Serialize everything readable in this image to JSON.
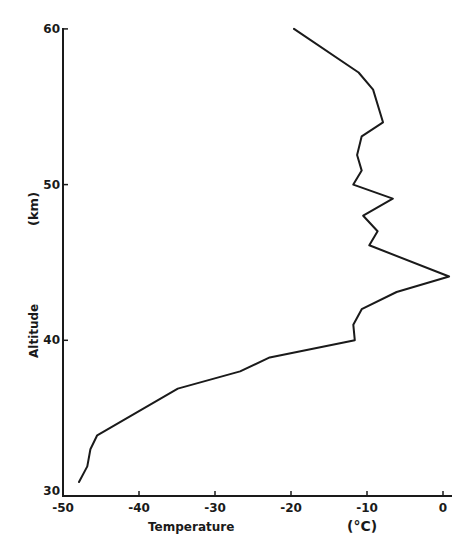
{
  "chart_data": {
    "type": "line",
    "title": "",
    "xlabel": "Temperature",
    "xunit": "(°C)",
    "ylabel": "Altitude",
    "yunit": "(km)",
    "xlim": [
      -50,
      1
    ],
    "ylim": [
      30,
      60
    ],
    "grid": false,
    "legend": null,
    "x_ticks": [
      -50,
      -40,
      -30,
      -20,
      -10,
      0
    ],
    "x_tick_labels": [
      "-50",
      "-40",
      "-30",
      "-20",
      "-10",
      "0"
    ],
    "y_ticks": [
      30,
      40,
      50,
      60
    ],
    "y_tick_labels": [
      "30",
      "40",
      "50",
      "60"
    ],
    "series": [
      {
        "name": "Temperature profile",
        "color": "#1a1a1a",
        "points": [
          {
            "t": -47.9,
            "alt": 30.9
          },
          {
            "t": -46.8,
            "alt": 31.9
          },
          {
            "t": -46.4,
            "alt": 33.0
          },
          {
            "t": -45.5,
            "alt": 33.9
          },
          {
            "t": -34.9,
            "alt": 36.9
          },
          {
            "t": -26.7,
            "alt": 38.0
          },
          {
            "t": -22.8,
            "alt": 38.9
          },
          {
            "t": -11.6,
            "alt": 40.0
          },
          {
            "t": -11.8,
            "alt": 41.0
          },
          {
            "t": -10.7,
            "alt": 42.0
          },
          {
            "t": -6.1,
            "alt": 43.1
          },
          {
            "t": 0.8,
            "alt": 44.1
          },
          {
            "t": -9.7,
            "alt": 46.1
          },
          {
            "t": -8.6,
            "alt": 47.0
          },
          {
            "t": -10.5,
            "alt": 48.0
          },
          {
            "t": -6.6,
            "alt": 49.1
          },
          {
            "t": -11.8,
            "alt": 50.0
          },
          {
            "t": -10.7,
            "alt": 50.9
          },
          {
            "t": -11.3,
            "alt": 51.9
          },
          {
            "t": -10.7,
            "alt": 53.1
          },
          {
            "t": -7.9,
            "alt": 54.0
          },
          {
            "t": -9.2,
            "alt": 56.1
          },
          {
            "t": -11.1,
            "alt": 57.2
          },
          {
            "t": -19.6,
            "alt": 60.0
          }
        ]
      }
    ]
  }
}
